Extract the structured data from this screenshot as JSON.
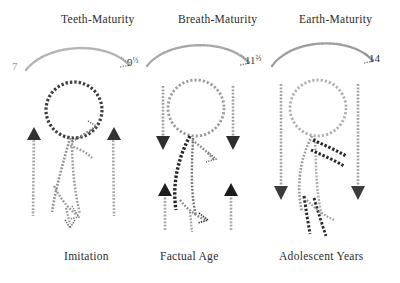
{
  "page": {
    "kind": "scanned-diagram",
    "background": "#ffffff",
    "ink_color": "#2b2b2b"
  },
  "headers": [
    {
      "label": "Teeth-Maturity",
      "x": 61,
      "y": 13
    },
    {
      "label": "Breath-Maturity",
      "x": 178,
      "y": 13
    },
    {
      "label": "Earth-Maturity",
      "x": 299,
      "y": 13
    }
  ],
  "ages": [
    {
      "whole": "7",
      "fraction": "",
      "x": 12,
      "y": 60,
      "tone": "#9a9a9a"
    },
    {
      "whole": "9",
      "fraction": "⅓",
      "x": 127,
      "y": 56,
      "tone": "#3a3a3a"
    },
    {
      "whole": "11",
      "fraction": "⅔",
      "x": 245,
      "y": 54,
      "tone": "#3a3a3a"
    },
    {
      "whole": "14",
      "fraction": "",
      "x": 369,
      "y": 52,
      "tone": "#2b2b2b"
    }
  ],
  "footers": [
    {
      "label": "Imitation",
      "x": 64,
      "y": 250
    },
    {
      "label": "Factual Age",
      "x": 160,
      "y": 250
    },
    {
      "label": "Adolescent Years",
      "x": 279,
      "y": 250
    }
  ],
  "arcs": [
    {
      "name": "arc-teeth-maturity",
      "from_age": "7",
      "to_age": "9⅓",
      "tone": "#b4b4b4"
    },
    {
      "name": "arc-breath-maturity",
      "from_age": "9⅓",
      "to_age": "11⅔",
      "tone": "#a8a8a8"
    },
    {
      "name": "arc-earth-maturity",
      "from_age": "11⅔",
      "to_age": "14",
      "tone": "#9e9e9e"
    }
  ],
  "figures": [
    {
      "name": "figure-imitation",
      "stage": "Imitation",
      "tone_head": "#3d3d3d",
      "tone_body": "#8e8e8e",
      "tone_limbs": "#a0a0a0",
      "arm_direction": "up",
      "leg_direction": "down"
    },
    {
      "name": "figure-factual-age",
      "stage": "Factual Age",
      "tone_head": "#9c9c9c",
      "tone_body": "#252525",
      "tone_limbs": "#777777",
      "arm_direction": "down",
      "leg_direction": "up"
    },
    {
      "name": "figure-adolescent-years",
      "stage": "Adolescent Years",
      "tone_head": "#b0b0b0",
      "tone_body": "#9a9a9a",
      "tone_limbs": "#2a2a2a",
      "arm_direction": "down",
      "leg_direction": "down"
    }
  ]
}
